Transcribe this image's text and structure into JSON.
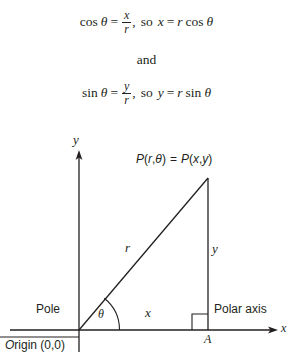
{
  "figure": {
    "type": "geometry-diagram",
    "formulas": {
      "equation1": {
        "lhs_func": "cos",
        "lhs_angle": "θ",
        "equals": "=",
        "fraction_numerator": "x",
        "fraction_denominator": "r",
        "comma": ",",
        "connector": "so",
        "rhs": "x = r cos θ",
        "rhs_var": "x",
        "rhs_equals": "=",
        "rhs_r": "r",
        "rhs_func": "cos",
        "rhs_angle": "θ",
        "full_text": "cos θ = x/r, so x = r cos θ"
      },
      "conjunction": "and",
      "equation2": {
        "lhs_func": "sin",
        "lhs_angle": "θ",
        "equals": "=",
        "fraction_numerator": "y",
        "fraction_denominator": "r",
        "comma": ",",
        "connector": "so",
        "rhs": "y = r sin θ",
        "rhs_var": "y",
        "rhs_equals": "=",
        "rhs_r": "r",
        "rhs_func": "sin",
        "rhs_angle": "θ",
        "full_text": "sin θ = y/r, so y = r sin θ"
      }
    },
    "axes": {
      "y_axis_label": "y",
      "x_axis_label": "x",
      "origin_label": "Origin (0,0)",
      "origin_label_first_letter": "O",
      "origin_label_rest": "rigin (0,0)"
    },
    "annotations": {
      "point_label": "P(r,θ) = P(x,y)",
      "point_label_parts": {
        "p1": "P",
        "open1": "(",
        "r": "r",
        "comma1": ",",
        "theta": "θ",
        "close1": ")",
        "equals": "=",
        "p2": "P",
        "open2": "(",
        "x": "x",
        "comma2": ",",
        "y": "y",
        "close2": ")"
      },
      "hypotenuse_label": "r",
      "horizontal_leg_label": "x",
      "vertical_leg_label": "y",
      "angle_label": "θ",
      "pole_label": "Pole",
      "polar_axis_label": "Polar axis",
      "foot_point_label": "A"
    },
    "colors": {
      "ink": "#231f20",
      "background": "#ffffff"
    }
  }
}
